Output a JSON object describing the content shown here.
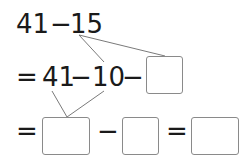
{
  "row1": {
    "left": "41",
    "op": "−",
    "right": "15"
  },
  "row2": {
    "eq": "=",
    "a": "41",
    "op1": "−",
    "b": "10",
    "op2": "−",
    "blank": ""
  },
  "row3": {
    "eq": "=",
    "blank1": "",
    "op": "−",
    "blank2": "",
    "eq2": "=",
    "blank3": ""
  },
  "colors": {
    "text": "#1a1a1a",
    "line": "#7a7a7a",
    "box_border": "#8a8a8a"
  }
}
